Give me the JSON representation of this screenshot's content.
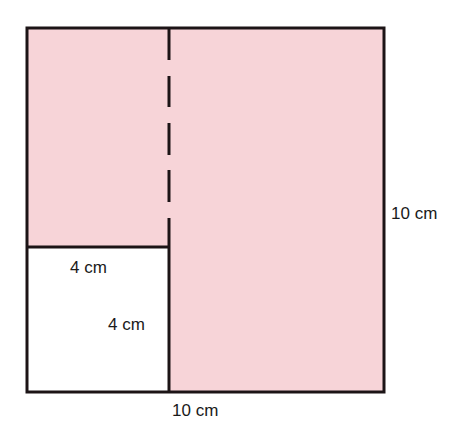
{
  "figure": {
    "fill_color": "#f7d4d8",
    "line_color": "#1c1416",
    "outer_square": {
      "side_label": "10 cm",
      "bottom_label": "10 cm"
    },
    "cut_square": {
      "top_label": "4 cm",
      "side_label": "4 cm",
      "fill": "#ffffff"
    },
    "fold_line": {
      "style": "dashed-then-solid"
    }
  }
}
